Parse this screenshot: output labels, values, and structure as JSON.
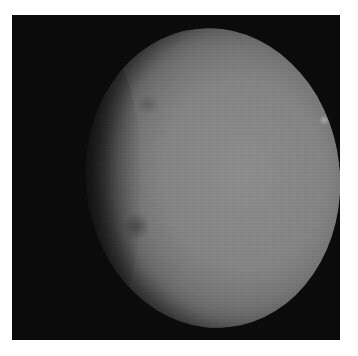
{
  "image": {
    "subject": "grayscale image of a cratered spherical planetary body (dwarf planet) against black space",
    "colors": {
      "page_background": "#ffffff",
      "space": "#0b0b0b",
      "surface_mid": "#858585",
      "bright_spot": "#e6e6e6"
    },
    "features": [
      "illuminated limb on right",
      "terminator shadow on left",
      "craters along terminator",
      "bright spot lower right"
    ]
  }
}
